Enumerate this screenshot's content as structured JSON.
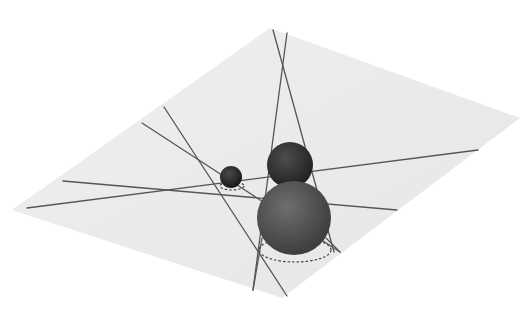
{
  "figure": {
    "colors": {
      "background": "#ffffff",
      "plane": "#ececec",
      "line": "#555555",
      "sphere_small": "#2a2a2a",
      "sphere_medium": "#333333",
      "sphere_large": "#5a5a5a"
    },
    "objects": {
      "plane": "tilted-ground-plane",
      "spheres": [
        {
          "name": "small-sphere",
          "size": "small"
        },
        {
          "name": "medium-sphere",
          "size": "medium"
        },
        {
          "name": "large-sphere",
          "size": "large"
        }
      ],
      "line_count": 8,
      "dashed_footprints": 2
    }
  }
}
